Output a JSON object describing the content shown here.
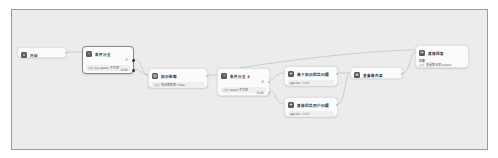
{
  "canvas": {
    "background": "#ececec",
    "border": "#9a9a9a"
  },
  "nodes": {
    "start": {
      "title": "开始",
      "icon": "home-icon"
    },
    "if1": {
      "title": "条件分支",
      "condition": "{x} sys.query 不为空",
      "if_label": "IF",
      "else_label": "ELSE",
      "icon": "branch-icon"
    },
    "retrieval": {
      "title": "知识检索",
      "query": "{x} 知识库检索 / files",
      "icon": "book-icon"
    },
    "if2": {
      "title": "条件分支 2",
      "condition": "{x} result 不为空",
      "if_label": "IF",
      "else_label": "ELSE",
      "icon": "branch-icon"
    },
    "llm1": {
      "title": "基于知识回答问题",
      "model": "gpt-4o",
      "model_tag": "CHAT",
      "icon": "llm-icon"
    },
    "llm2": {
      "title": "直接回答用户问题",
      "model": "gpt-4o",
      "model_tag": "CHAT",
      "icon": "llm-icon"
    },
    "aggregator": {
      "title": "变量聚合器",
      "icon": "aggregate-icon"
    },
    "answer": {
      "title": "直接回复",
      "label": "回复",
      "content": "{x} 变量聚合器.output",
      "icon": "answer-icon"
    }
  },
  "edges": [
    {
      "from": "start",
      "to": "if1"
    },
    {
      "from": "if1.if",
      "to": "retrieval"
    },
    {
      "from": "if1.else",
      "to": "retrieval"
    },
    {
      "from": "retrieval",
      "to": "if2"
    },
    {
      "from": "if2.if",
      "to": "llm1"
    },
    {
      "from": "if2.else",
      "to": "llm2"
    },
    {
      "from": "llm1",
      "to": "aggregator"
    },
    {
      "from": "llm2",
      "to": "aggregator"
    },
    {
      "from": "aggregator",
      "to": "answer"
    },
    {
      "from": "if2",
      "to": "answer"
    }
  ]
}
